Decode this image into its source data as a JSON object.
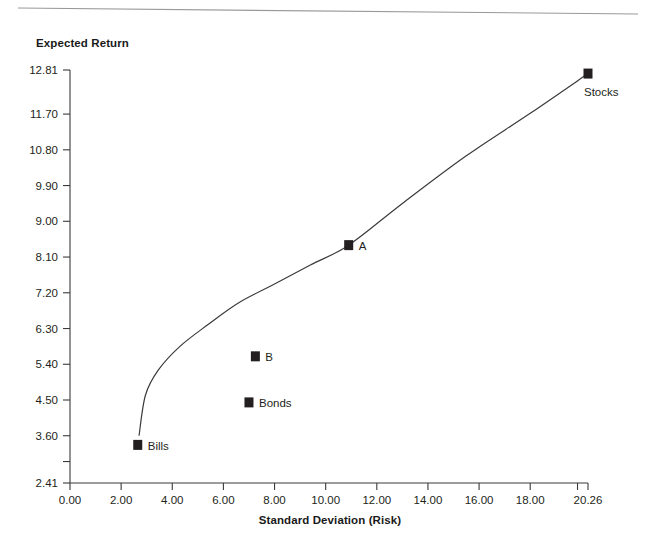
{
  "chart_data": {
    "type": "scatter",
    "title": "",
    "xlabel": "Standard Deviation (Risk)",
    "ylabel": "Expected Return",
    "xlim": [
      0.0,
      20.26
    ],
    "ylim": [
      2.41,
      12.81
    ],
    "grid": false,
    "legend": "none",
    "x_ticks": [
      "0.00",
      "2.00",
      "4.00",
      "6.00",
      "8.00",
      "10.00",
      "12.00",
      "14.00",
      "16.00",
      "18.00",
      "20.26"
    ],
    "x_tick_values": [
      0.0,
      2.0,
      4.0,
      6.0,
      8.0,
      10.0,
      12.0,
      14.0,
      16.0,
      18.0,
      20.26
    ],
    "y_ticks": [
      "12.81",
      "11.70",
      "10.80",
      "9.90",
      "9.00",
      "8.10",
      "7.20",
      "6.30",
      "5.40",
      "4.50",
      "3.60",
      "",
      "2.41"
    ],
    "y_tick_values": [
      12.81,
      11.7,
      10.8,
      9.9,
      9.0,
      8.1,
      7.2,
      6.3,
      5.4,
      4.5,
      3.6,
      2.95,
      2.41
    ],
    "points": [
      {
        "label": "Bills",
        "x": 2.65,
        "y": 3.37,
        "on_curve": false
      },
      {
        "label": "Bonds",
        "x": 7.0,
        "y": 4.44,
        "on_curve": false
      },
      {
        "label": "B",
        "x": 7.25,
        "y": 5.6,
        "on_curve": false
      },
      {
        "label": "A",
        "x": 10.9,
        "y": 8.4,
        "on_curve": true
      },
      {
        "label": "Stocks",
        "x": 20.26,
        "y": 12.72,
        "on_curve": true
      }
    ],
    "curve": {
      "name": "efficient-frontier",
      "points": [
        {
          "x": 2.7,
          "y": 3.6
        },
        {
          "x": 2.95,
          "y": 4.62
        },
        {
          "x": 3.45,
          "y": 5.25
        },
        {
          "x": 4.3,
          "y": 5.85
        },
        {
          "x": 5.4,
          "y": 6.4
        },
        {
          "x": 6.6,
          "y": 6.95
        },
        {
          "x": 8.0,
          "y": 7.42
        },
        {
          "x": 9.4,
          "y": 7.9
        },
        {
          "x": 10.9,
          "y": 8.4
        },
        {
          "x": 13.0,
          "y": 9.45
        },
        {
          "x": 15.5,
          "y": 10.65
        },
        {
          "x": 18.0,
          "y": 11.72
        },
        {
          "x": 20.26,
          "y": 12.72
        }
      ]
    }
  },
  "axes": {
    "y_title": "Expected Return",
    "x_title": "Standard Deviation (Risk)"
  }
}
